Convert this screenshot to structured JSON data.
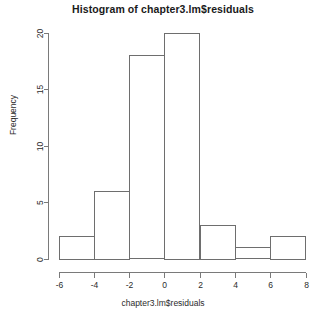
{
  "chart_data": {
    "type": "bar",
    "title": "Histogram of chapter3.lm$residuals",
    "xlabel": "chapter3.lm$residuals",
    "ylabel": "Frequency",
    "grid": false,
    "legend": null,
    "bin_width": 2,
    "bin_edges": [
      -6,
      -4,
      -2,
      0,
      2,
      4,
      6,
      8
    ],
    "categories": [
      "-6 to -4",
      "-4 to -2",
      "-2 to 0",
      "0 to 2",
      "2 to 4",
      "4 to 6",
      "6 to 8"
    ],
    "values": [
      2,
      6,
      18,
      20,
      3,
      1,
      2
    ],
    "bins": [
      {
        "left": -6,
        "right": -4,
        "count": 2
      },
      {
        "left": -4,
        "right": -2,
        "count": 6
      },
      {
        "left": -2,
        "right": 0,
        "count": 18
      },
      {
        "left": 0,
        "right": 2,
        "count": 20
      },
      {
        "left": 2,
        "right": 4,
        "count": 3
      },
      {
        "left": 4,
        "right": 6,
        "count": 1
      },
      {
        "left": 6,
        "right": 8,
        "count": 2
      }
    ],
    "xlim": [
      -6,
      8
    ],
    "ylim": [
      0,
      20
    ],
    "xticks": [
      -6,
      -4,
      -2,
      0,
      2,
      4,
      6,
      8
    ],
    "xticklabels": [
      "-6",
      "-4",
      "-2",
      "0",
      "2",
      "4",
      "6",
      "8"
    ],
    "yticks": [
      0,
      5,
      10,
      15,
      20
    ],
    "yticklabels": [
      "0",
      "5",
      "10",
      "15",
      "20"
    ],
    "total_count": 52
  },
  "style": {
    "background": "#ffffff",
    "axis_color": "#7a7a7a",
    "bar_stroke": "#6e6e6e",
    "bar_fill": "#ffffff",
    "text_color": "#2b2b2b",
    "title_color": "#1a1a1a"
  }
}
